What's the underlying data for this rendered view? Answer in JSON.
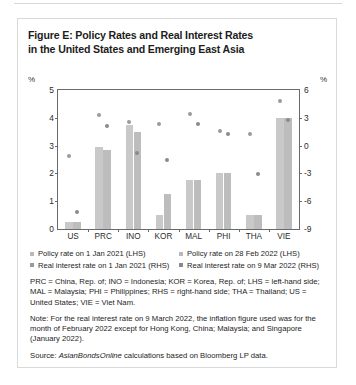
{
  "figure": {
    "title": "Figure E: Policy Rates and Real Interest Rates in the United States and Emerging East Asia",
    "title_line1": "Figure E: Policy Rates and Real Interest Rates",
    "title_line2": "in the United States and Emerging East Asia",
    "unit_left": "%",
    "unit_right": "%"
  },
  "legend": {
    "items": [
      {
        "label": "Policy rate on 1 Jan 2021 (LHS)",
        "color": "#b9b9b9",
        "marker": "square"
      },
      {
        "label": "Policy rate on 28 Feb 2022 (LHS)",
        "color": "#b9b9b9",
        "marker": "square"
      },
      {
        "label": "Real interest rate on 1 Jan 2021 (RHS)",
        "color": "#9a9a9a",
        "marker": "square"
      },
      {
        "label": "Real interest rate on 9 Mar 2022 (RHS)",
        "color": "#8a8a8a",
        "marker": "square"
      }
    ]
  },
  "notes": {
    "abbreviations": "PRC = China, Rep. of; INO = Indonesia; KOR = Korea, Rep. of; LHS = left-hand side; MAL = Malaysia; PHI = Philippines; RHS = right-hand side; THA = Thailand; US = United States; VIE = Viet Nam.",
    "note": "Note: For the real interest rate on 9 March 2022, the inflation figure used was for the month of February 2022 except for Hong Kong, China; Malaysia; and Singapore (January 2022).",
    "source_prefix": "Source: ",
    "source_italic": "AsianBondsOnline",
    "source_suffix": " calculations based on Bloomberg LP data."
  },
  "chart_data": {
    "type": "bar",
    "title": "Figure E: Policy Rates and Real Interest Rates in the United States and Emerging East Asia",
    "xlabel": "",
    "ylabel": "%",
    "y2label": "%",
    "categories": [
      "US",
      "PRC",
      "INO",
      "KOR",
      "MAL",
      "PHI",
      "THA",
      "VIE"
    ],
    "ylim": [
      0,
      5
    ],
    "yticks": [
      0,
      1,
      2,
      3,
      4,
      5
    ],
    "y2lim": [
      -9,
      6
    ],
    "y2ticks": [
      -9,
      -6,
      -3,
      0,
      3,
      6
    ],
    "grid": false,
    "legend_position": "bottom",
    "series": [
      {
        "name": "Policy rate on 1 Jan 2021 (LHS)",
        "axis": "left",
        "kind": "bar",
        "color": "#c9c9c9",
        "values": [
          0.25,
          2.95,
          3.75,
          0.5,
          1.75,
          2.0,
          0.5,
          4.0
        ]
      },
      {
        "name": "Policy rate on 28 Feb 2022 (LHS)",
        "axis": "left",
        "kind": "bar",
        "color": "#bdbdbd",
        "values": [
          0.25,
          2.85,
          3.5,
          1.25,
          1.75,
          2.0,
          0.5,
          4.0
        ]
      },
      {
        "name": "Real interest rate on 1 Jan 2021 (RHS)",
        "axis": "right",
        "kind": "scatter",
        "color": "#9a9a9a",
        "values": [
          -1.1,
          3.3,
          2.6,
          2.3,
          3.4,
          1.6,
          1.2,
          4.8
        ]
      },
      {
        "name": "Real interest rate on 9 Mar 2022 (RHS)",
        "axis": "right",
        "kind": "scatter",
        "color": "#8a8a8a",
        "values": [
          -7.2,
          2.1,
          -0.8,
          -1.6,
          2.3,
          1.2,
          -3.1,
          2.8
        ]
      }
    ]
  }
}
